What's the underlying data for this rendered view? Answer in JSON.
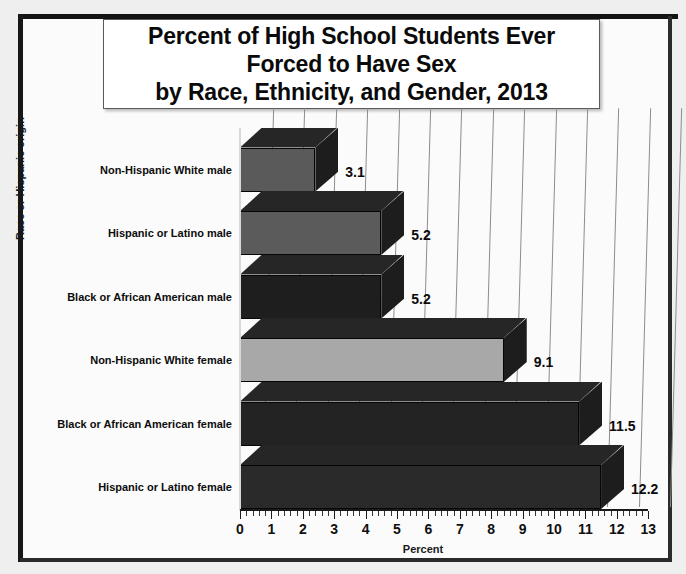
{
  "chart_data": {
    "type": "bar",
    "orientation": "horizontal",
    "title": "Percent of High School Students Ever Forced to Have Sex by Race, Ethnicity, and Gender, 2013",
    "title_lines": [
      "Percent of High School Students Ever",
      "Forced to Have Sex",
      "by Race, Ethnicity, and Gender, 2013"
    ],
    "xlabel": "Percent",
    "ylabel": "Race or Hispanic origin",
    "xlim": [
      0,
      13
    ],
    "xticks": [
      0,
      1,
      2,
      3,
      4,
      5,
      6,
      7,
      8,
      9,
      10,
      11,
      12,
      13
    ],
    "xtick_labels": [
      "0",
      "1",
      "2",
      "3",
      "4",
      "5",
      "6",
      "7",
      "8",
      "9",
      "10",
      "11",
      "12",
      "13"
    ],
    "minor_ticks_per_interval": 5,
    "grid": true,
    "grid_axis": "x",
    "legend": false,
    "style_3d": true,
    "categories": [
      "Non-Hispanic White male",
      "Hispanic or Latino male",
      "Black or African American male",
      "Non-Hispanic White female",
      "Black or African American female",
      "Hispanic or Latino female"
    ],
    "values": [
      3.1,
      5.2,
      5.2,
      9.1,
      11.5,
      12.2
    ],
    "value_labels": [
      "3.1",
      "5.2",
      "5.2",
      "9.1",
      "11.5",
      "12.2"
    ],
    "bar_colors": [
      "#5a5a5a",
      "#5b5b5b",
      "#1e1e1e",
      "#a8a8a8",
      "#232323",
      "#2a2a2a"
    ]
  },
  "colors": {
    "page_background": "#fbfbfb",
    "frame": "#141414",
    "gridline": "#8c8c8c",
    "axis": "#1a1a1a",
    "text": "#0a0a0a",
    "title_box_background": "#ffffff"
  }
}
